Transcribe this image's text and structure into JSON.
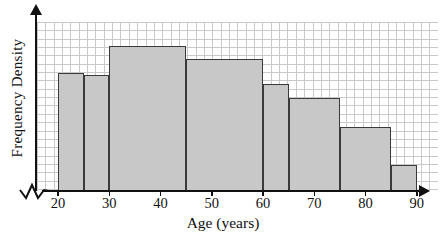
{
  "chart_data": {
    "type": "bar",
    "subtype": "histogram",
    "title": "",
    "xlabel": "Age (years)",
    "ylabel": "Frequency Density",
    "x_ticks": [
      20,
      30,
      40,
      50,
      60,
      70,
      80,
      90
    ],
    "x_range": [
      20,
      90
    ],
    "y_axis_tick_labels_shown": false,
    "grid": true,
    "legend": false,
    "bar_fill_color": "#c8c8c8",
    "bar_border_color": "#3a3a3a",
    "grid_color": "#c9c9c9",
    "axis_color": "#111111",
    "bins": [
      {
        "start": 20,
        "end": 25,
        "fd_grid_squares": 14.2
      },
      {
        "start": 25,
        "end": 30,
        "fd_grid_squares": 13.9
      },
      {
        "start": 30,
        "end": 45,
        "fd_grid_squares": 17.4
      },
      {
        "start": 45,
        "end": 60,
        "fd_grid_squares": 15.9
      },
      {
        "start": 60,
        "end": 65,
        "fd_grid_squares": 12.9
      },
      {
        "start": 65,
        "end": 75,
        "fd_grid_squares": 11.2
      },
      {
        "start": 75,
        "end": 85,
        "fd_grid_squares": 7.7
      },
      {
        "start": 85,
        "end": 90,
        "fd_grid_squares": 3.1
      }
    ]
  }
}
